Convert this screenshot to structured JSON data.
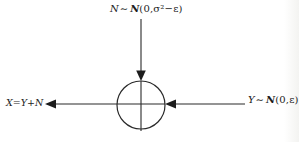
{
  "canvas": {
    "width": 299,
    "height": 142,
    "background": "#ffffff",
    "ink": "#1c1c1c"
  },
  "adder": {
    "symbol": "plus-in-circle",
    "description": "summation node combining noise N and signal Y"
  },
  "labels": {
    "noise_input": {
      "variable": "N",
      "relation": "∼",
      "distribution": "N",
      "parameters": "(0,σ²−ε)"
    },
    "signal_input": {
      "variable": "Y",
      "relation": "∼",
      "distribution": "N",
      "parameters": "(0,ε)"
    },
    "output": {
      "expression": "X=Y+N"
    }
  }
}
